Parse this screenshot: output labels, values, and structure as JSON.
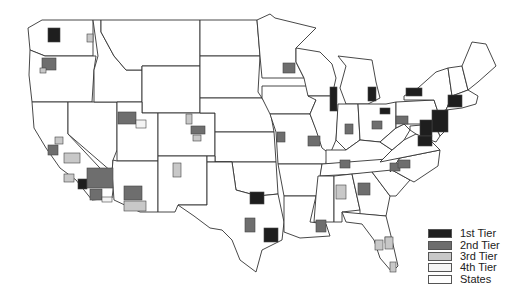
{
  "map": {
    "title": "",
    "colors": {
      "tier1": "#1e1e1e",
      "tier2": "#6e6e6e",
      "tier3": "#c8c8c8",
      "tier4": "#f4f4f4",
      "states": "#ffffff",
      "border": "#333333"
    }
  },
  "legend": {
    "items": [
      {
        "key": "tier1",
        "label": "1st Tier",
        "color": "#1e1e1e"
      },
      {
        "key": "tier2",
        "label": "2nd Tier",
        "color": "#6e6e6e"
      },
      {
        "key": "tier3",
        "label": "3rd Tier",
        "color": "#c8c8c8"
      },
      {
        "key": "tier4",
        "label": "4th Tier",
        "color": "#f4f4f4"
      },
      {
        "key": "states",
        "label": "States",
        "color": "#ffffff"
      }
    ]
  },
  "patches": [
    {
      "region": "Seattle",
      "tier": "tier1",
      "x": 48,
      "y": 28,
      "w": 12,
      "h": 14
    },
    {
      "region": "Spokane",
      "tier": "tier3",
      "x": 87,
      "y": 34,
      "w": 6,
      "h": 8
    },
    {
      "region": "Portland",
      "tier": "tier2",
      "x": 42,
      "y": 58,
      "w": 14,
      "h": 12
    },
    {
      "region": "Salem",
      "tier": "tier3",
      "x": 40,
      "y": 68,
      "w": 6,
      "h": 5
    },
    {
      "region": "Salt Lake City",
      "tier": "tier2",
      "x": 118,
      "y": 112,
      "w": 18,
      "h": 12
    },
    {
      "region": "Provo",
      "tier": "tier4",
      "x": 136,
      "y": 120,
      "w": 10,
      "h": 8
    },
    {
      "region": "Denver",
      "tier": "tier2",
      "x": 191,
      "y": 126,
      "w": 14,
      "h": 8
    },
    {
      "region": "Colorado Springs",
      "tier": "tier3",
      "x": 193,
      "y": 135,
      "w": 8,
      "h": 6
    },
    {
      "region": "Fort Collins",
      "tier": "tier3",
      "x": 186,
      "y": 114,
      "w": 6,
      "h": 10
    },
    {
      "region": "San Francisco",
      "tier": "tier2",
      "x": 48,
      "y": 145,
      "w": 10,
      "h": 10
    },
    {
      "region": "Sacramento",
      "tier": "tier3",
      "x": 55,
      "y": 137,
      "w": 8,
      "h": 7
    },
    {
      "region": "Fresno",
      "tier": "tier3",
      "x": 64,
      "y": 153,
      "w": 16,
      "h": 10
    },
    {
      "region": "Central Coast",
      "tier": "tier3",
      "x": 64,
      "y": 174,
      "w": 10,
      "h": 8
    },
    {
      "region": "Los Angeles",
      "tier": "tier1",
      "x": 78,
      "y": 179,
      "w": 9,
      "h": 10
    },
    {
      "region": "Inland Empire",
      "tier": "tier2",
      "x": 87,
      "y": 168,
      "w": 26,
      "h": 20
    },
    {
      "region": "San Diego",
      "tier": "tier2",
      "x": 90,
      "y": 189,
      "w": 12,
      "h": 11
    },
    {
      "region": "Las Vegas",
      "tier": "tier4",
      "x": 102,
      "y": 197,
      "w": 10,
      "h": 5
    },
    {
      "region": "Phoenix",
      "tier": "tier2",
      "x": 124,
      "y": 186,
      "w": 18,
      "h": 14
    },
    {
      "region": "Tucson",
      "tier": "tier3",
      "x": 124,
      "y": 201,
      "w": 22,
      "h": 10
    },
    {
      "region": "Albuquerque",
      "tier": "tier3",
      "x": 173,
      "y": 163,
      "w": 8,
      "h": 14
    },
    {
      "region": "Dallas",
      "tier": "tier1",
      "x": 250,
      "y": 192,
      "w": 14,
      "h": 12
    },
    {
      "region": "Houston",
      "tier": "tier1",
      "x": 264,
      "y": 228,
      "w": 14,
      "h": 14
    },
    {
      "region": "Austin",
      "tier": "tier2",
      "x": 245,
      "y": 218,
      "w": 10,
      "h": 14
    },
    {
      "region": "Minneapolis",
      "tier": "tier2",
      "x": 283,
      "y": 63,
      "w": 12,
      "h": 10
    },
    {
      "region": "Chicago",
      "tier": "tier1",
      "x": 330,
      "y": 87,
      "w": 7,
      "h": 24
    },
    {
      "region": "Detroit",
      "tier": "tier1",
      "x": 368,
      "y": 87,
      "w": 8,
      "h": 14
    },
    {
      "region": "Cleveland",
      "tier": "tier1",
      "x": 380,
      "y": 108,
      "w": 10,
      "h": 6
    },
    {
      "region": "St. Louis",
      "tier": "tier2",
      "x": 308,
      "y": 136,
      "w": 12,
      "h": 10
    },
    {
      "region": "Kansas City",
      "tier": "tier2",
      "x": 277,
      "y": 132,
      "w": 8,
      "h": 10
    },
    {
      "region": "Indianapolis",
      "tier": "tier2",
      "x": 345,
      "y": 124,
      "w": 8,
      "h": 10
    },
    {
      "region": "Columbus",
      "tier": "tier2",
      "x": 372,
      "y": 121,
      "w": 10,
      "h": 8
    },
    {
      "region": "Pittsburgh",
      "tier": "tier2",
      "x": 396,
      "y": 116,
      "w": 12,
      "h": 8
    },
    {
      "region": "Buffalo",
      "tier": "tier1",
      "x": 406,
      "y": 88,
      "w": 16,
      "h": 8
    },
    {
      "region": "New York",
      "tier": "tier1",
      "x": 432,
      "y": 110,
      "w": 16,
      "h": 22
    },
    {
      "region": "Philadelphia",
      "tier": "tier1",
      "x": 420,
      "y": 120,
      "w": 12,
      "h": 16
    },
    {
      "region": "Boston",
      "tier": "tier1",
      "x": 448,
      "y": 95,
      "w": 14,
      "h": 12
    },
    {
      "region": "Washington DC",
      "tier": "tier1",
      "x": 418,
      "y": 136,
      "w": 14,
      "h": 10
    },
    {
      "region": "Nashville",
      "tier": "tier2",
      "x": 340,
      "y": 160,
      "w": 10,
      "h": 8
    },
    {
      "region": "Atlanta",
      "tier": "tier2",
      "x": 358,
      "y": 183,
      "w": 12,
      "h": 12
    },
    {
      "region": "Charlotte",
      "tier": "tier2",
      "x": 390,
      "y": 163,
      "w": 10,
      "h": 8
    },
    {
      "region": "Raleigh",
      "tier": "tier2",
      "x": 398,
      "y": 160,
      "w": 12,
      "h": 8
    },
    {
      "region": "Birmingham",
      "tier": "tier3",
      "x": 336,
      "y": 185,
      "w": 10,
      "h": 14
    },
    {
      "region": "New Orleans",
      "tier": "tier2",
      "x": 316,
      "y": 220,
      "w": 10,
      "h": 12
    },
    {
      "region": "Jacksonville",
      "tier": "tier3",
      "x": 385,
      "y": 237,
      "w": 6,
      "h": 6
    },
    {
      "region": "Orlando",
      "tier": "tier3",
      "x": 385,
      "y": 237,
      "w": 8,
      "h": 12
    },
    {
      "region": "Tampa",
      "tier": "tier3",
      "x": 375,
      "y": 240,
      "w": 8,
      "h": 10
    },
    {
      "region": "Miami",
      "tier": "tier3",
      "x": 390,
      "y": 262,
      "w": 6,
      "h": 10
    }
  ]
}
